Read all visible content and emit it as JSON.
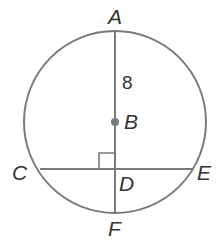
{
  "diagram": {
    "labels": {
      "A": "A",
      "B": "B",
      "C": "C",
      "D": "D",
      "E": "E",
      "F": "F"
    },
    "segment_AB_length": "8",
    "colors": {
      "stroke": "#7a7a7a",
      "text": "#333333"
    }
  }
}
